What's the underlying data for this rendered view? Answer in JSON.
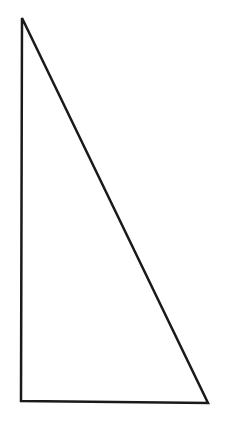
{
  "diagram": {
    "type": "right-triangle",
    "background": "#ffffff",
    "stroke": "#1a1a1a",
    "stroke_width": 2.5,
    "vertices": [
      {
        "name": "top",
        "x": 22,
        "y": 18
      },
      {
        "name": "bottom-left",
        "x": 21,
        "y": 401
      },
      {
        "name": "bottom-right",
        "x": 208,
        "y": 403
      }
    ]
  }
}
